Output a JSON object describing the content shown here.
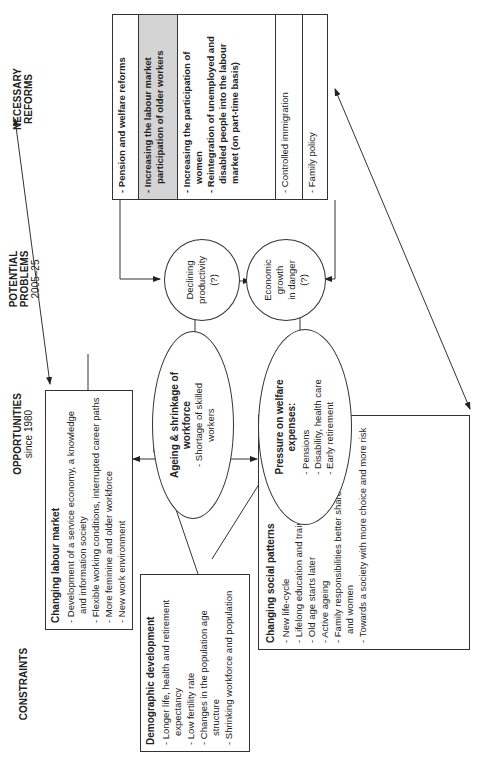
{
  "headers": {
    "constraints": {
      "title": "CONSTRAINTS"
    },
    "opportunities": {
      "title": "OPPORTUNITIES",
      "sub": "since 1980"
    },
    "problems": {
      "title": "POTENTIAL PROBLEMS",
      "sub": "2005–25"
    },
    "reforms": {
      "title": "NECESSARY REFORMS"
    }
  },
  "demographic": {
    "title": "Demographic development",
    "items": [
      "Longer life, health and retirement expectancy",
      "Low fertility rate",
      "Changes in the population age structure",
      "Shrinking workforce and population"
    ]
  },
  "labour_market": {
    "title": "Changing labour market",
    "items": [
      "Development of a service economy, a knowledge and information society",
      "Flexible working conditions, interrupted career paths",
      "More feminine and older workforce",
      "New work environment"
    ]
  },
  "social_patterns": {
    "title": "Changing social patterns",
    "items": [
      "New life-cycle",
      "Lifelong education and training",
      "Old age starts later",
      "Active ageing",
      "Family responsibilities better shared between men and women",
      "Towards a society with more choice and more risk"
    ]
  },
  "ageing": {
    "title": "Ageing & shrinkage of workforce",
    "items": [
      "Shortage of skilled workers"
    ]
  },
  "welfare": {
    "title": "Pressure on welfare expenses:",
    "items": [
      "Pensions",
      "Disability, health care",
      "Early retirement"
    ]
  },
  "productivity": {
    "line1": "Declining",
    "line2": "productivity",
    "line3": "(?)"
  },
  "growth": {
    "line1": "Economic",
    "line2": "growth",
    "line3": "in danger",
    "line4": "(?)"
  },
  "reforms": {
    "rows": [
      {
        "items": [
          "Pension and welfare reforms"
        ]
      },
      {
        "items": [
          "Increasing the labour market participation of older workers"
        ]
      },
      {
        "items": [
          "Increasing the participation of women",
          "Reintegration of unemployed and disabled people into the labour market (on part-time basis)"
        ]
      },
      {
        "items": [
          "Controlled immigration"
        ]
      },
      {
        "items": [
          "Family policy"
        ]
      }
    ]
  },
  "colors": {
    "line": "#333333",
    "highlight_row": "#d4d4d4"
  }
}
